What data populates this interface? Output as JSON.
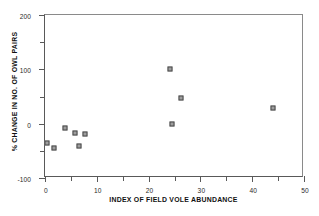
{
  "chart_data": {
    "type": "scatter",
    "title": "",
    "xlabel": "INDEX OF FIELD VOLE ABUNDANCE",
    "ylabel": "% CHANGE IN NO. OF OWL PAIRS",
    "xlim": [
      0,
      50
    ],
    "ylim": [
      -100,
      200
    ],
    "grid": false,
    "legend": null,
    "xticks": [
      0,
      10,
      20,
      30,
      40,
      50
    ],
    "xtick_labels": [
      "0",
      "10",
      "20",
      "30",
      "40",
      "50"
    ],
    "x_minor_ticks": [
      5,
      15,
      25,
      35,
      45
    ],
    "yticks": [
      -100,
      0,
      100,
      200
    ],
    "ytick_labels": [
      "-100",
      "0",
      "100",
      "200"
    ],
    "y_minor_ticks": [
      -50,
      50,
      150
    ],
    "marker_style": "open-square",
    "marker_color": "#9e9e9e",
    "marker_edge_color": "#4a4a4a",
    "axis_color": "#595959",
    "points": [
      {
        "x": 0.4,
        "y": -35
      },
      {
        "x": 1.7,
        "y": -44
      },
      {
        "x": 3.9,
        "y": -8
      },
      {
        "x": 5.8,
        "y": -17
      },
      {
        "x": 6.6,
        "y": -42
      },
      {
        "x": 7.7,
        "y": -19
      },
      {
        "x": 24.1,
        "y": 101
      },
      {
        "x": 24.5,
        "y": 0
      },
      {
        "x": 26.3,
        "y": 48
      },
      {
        "x": 44.0,
        "y": 29
      }
    ]
  }
}
